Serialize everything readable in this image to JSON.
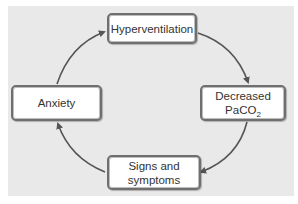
{
  "diagram": {
    "type": "cycle",
    "nodes": [
      {
        "id": "hyperventilation",
        "label": "Hyperventilation"
      },
      {
        "id": "decreased-paco2",
        "line1": "Decreased",
        "line2_main": "PaCO",
        "line2_sub": "2"
      },
      {
        "id": "signs-symptoms",
        "line1": "Signs and",
        "line2": "symptoms"
      },
      {
        "id": "anxiety",
        "label": "Anxiety"
      }
    ],
    "edges": [
      {
        "from": "hyperventilation",
        "to": "decreased-paco2"
      },
      {
        "from": "decreased-paco2",
        "to": "signs-symptoms"
      },
      {
        "from": "signs-symptoms",
        "to": "anxiety"
      },
      {
        "from": "anxiety",
        "to": "hyperventilation"
      }
    ],
    "colors": {
      "background": "#e9e9e9",
      "node_fill": "#ffffff",
      "node_border": "#6f6f6f",
      "arrow": "#555555",
      "text": "#333333"
    }
  }
}
